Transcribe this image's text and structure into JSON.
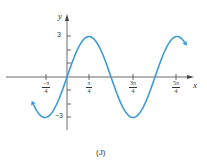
{
  "chart_data": {
    "type": "line",
    "title": "",
    "caption": "(J)",
    "function": "y = 3 sin(2x)",
    "xlabel": "x",
    "ylabel": "y",
    "xlim": [
      -1.32,
      4.3
    ],
    "ylim": [
      -3.6,
      3.6
    ],
    "x_ticks": [
      {
        "value": -0.7854,
        "label_num": "−π",
        "label_den": "4"
      },
      {
        "value": 0.7854,
        "label_num": "π",
        "label_den": "4"
      },
      {
        "value": 2.3562,
        "label_num": "3π",
        "label_den": "4"
      },
      {
        "value": 3.927,
        "label_num": "5π",
        "label_den": "4"
      }
    ],
    "y_ticks": [
      {
        "value": 3,
        "label": "3"
      },
      {
        "value": -3,
        "label": "−3"
      }
    ],
    "series": [
      {
        "name": "3 sin(2x)",
        "color": "#3d9bd3",
        "x": [
          -1.2,
          -0.7854,
          0,
          0.7854,
          1.5708,
          2.3562,
          3.1416,
          3.927,
          4.2
        ],
        "values": [
          -2.03,
          -3,
          0,
          3,
          0,
          -3,
          0,
          3,
          2.56
        ]
      }
    ],
    "grid": false,
    "legend": null
  }
}
